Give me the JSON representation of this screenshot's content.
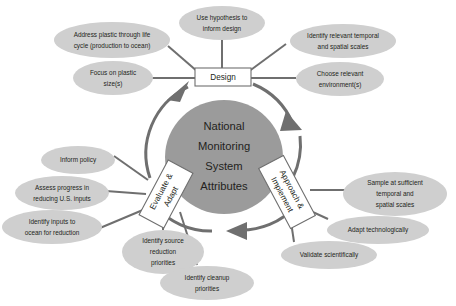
{
  "diagram": {
    "center": {
      "name": "national-monitoring-system-attributes",
      "lines": [
        "National",
        "Monitoring",
        "System",
        "Attributes"
      ],
      "fill": "#9b9b9b"
    },
    "colors": {
      "ellipse_fill": "#cfcfcf",
      "center_fill": "#9b9b9b",
      "line": "#6f6f6f",
      "text": "#231f20",
      "background": "#ffffff",
      "box_fill": "#ffffff"
    },
    "stages": [
      {
        "id": "design",
        "label": "Design",
        "lines": [
          "Design"
        ],
        "rotation": 0
      },
      {
        "id": "approach-implement",
        "label": "Approach & Implement",
        "lines": [
          "Approach &",
          "Implement"
        ],
        "rotation": 62
      },
      {
        "id": "evaluate-adapt",
        "label": "Evaluate & Adapt",
        "lines": [
          "Evaluate &",
          "Adapt"
        ],
        "rotation": -62
      }
    ],
    "attributes": [
      {
        "id": "address-plastic-through-life-cycle",
        "stage": "design",
        "lines": [
          "Address plastic through life",
          "cycle (production to ocean)"
        ]
      },
      {
        "id": "use-hypothesis-to-inform-design",
        "stage": "design",
        "lines": [
          "Use hypothesis to",
          "inform design"
        ]
      },
      {
        "id": "identify-relevant-temporal-and-spatial-scales",
        "stage": "design",
        "lines": [
          "Identify relevant temporal",
          "and spatial scales"
        ]
      },
      {
        "id": "focus-on-plastic-sizes",
        "stage": "design",
        "lines": [
          "Focus on plastic",
          "size(s)"
        ]
      },
      {
        "id": "choose-relevant-environments",
        "stage": "design",
        "lines": [
          "Choose relevant",
          "environment(s)"
        ]
      },
      {
        "id": "sample-at-sufficient-temporal-and-spatial-scales",
        "stage": "approach-implement",
        "lines": [
          "Sample at sufficient",
          "temporal and",
          "spatial scales"
        ]
      },
      {
        "id": "adapt-technologically",
        "stage": "approach-implement",
        "lines": [
          "Adapt technologically"
        ]
      },
      {
        "id": "validate-scientifically",
        "stage": "approach-implement",
        "lines": [
          "Validate scientifically"
        ]
      },
      {
        "id": "inform-policy",
        "stage": "evaluate-adapt",
        "lines": [
          "Inform policy"
        ]
      },
      {
        "id": "assess-progress-in-reducing-us-inputs",
        "stage": "evaluate-adapt",
        "lines": [
          "Assess progress in",
          "reducing U.S. inputs"
        ]
      },
      {
        "id": "identify-inputs-to-ocean-for-reduction",
        "stage": "evaluate-adapt",
        "lines": [
          "Identify inputs to",
          "ocean for reduction"
        ]
      },
      {
        "id": "identify-source-reduction-priorities",
        "stage": "evaluate-adapt",
        "lines": [
          "Identify source",
          "reduction",
          "priorities"
        ]
      },
      {
        "id": "identify-cleanup-priorities",
        "stage": "evaluate-adapt",
        "lines": [
          "Identify cleanup",
          "priorities"
        ]
      }
    ]
  }
}
